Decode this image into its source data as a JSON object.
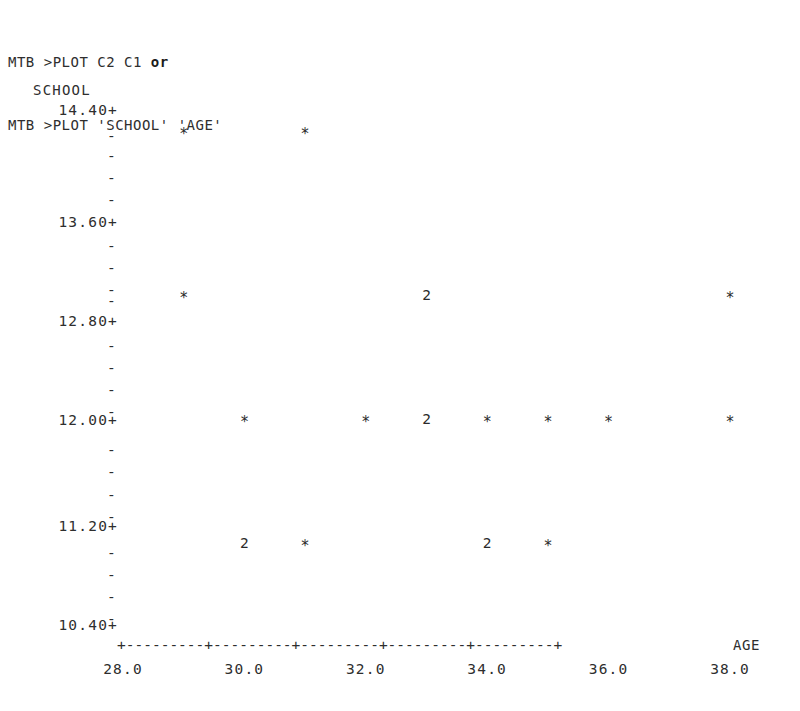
{
  "terminal": {
    "lines": [
      {
        "prompt": "MTB >PLOT C2 C1 ",
        "suffix": "or"
      },
      {
        "prompt": "MTB >PLOT 'SCHOOL' 'AGE'",
        "suffix": ""
      }
    ],
    "line1_full": "MTB >PLOT C2 C1 or",
    "line2_full": "MTB >PLOT 'SCHOOL' 'AGE'"
  },
  "axis": {
    "y_title": "SCHOOL",
    "x_title": "AGE",
    "axis_line": "+---------+---------+---------+---------+---------+",
    "tick_dash": "-",
    "tick_plus": "+"
  },
  "chart_data": {
    "type": "scatter",
    "title": "",
    "subtitle": "",
    "xlabel": "AGE",
    "ylabel": "SCHOOL",
    "xlim": [
      27.0,
      39.0
    ],
    "ylim": [
      10.4,
      14.4
    ],
    "xticks": [
      "28.0",
      "30.0",
      "32.0",
      "34.0",
      "36.0",
      "38.0"
    ],
    "xtick_values": [
      28.0,
      30.0,
      32.0,
      34.0,
      36.0,
      38.0
    ],
    "yticks": [
      "14.40+",
      "13.60+",
      "12.80+",
      "12.00+",
      "11.20+",
      "10.40+"
    ],
    "ytick_values": [
      14.4,
      13.6,
      12.8,
      12.0,
      11.2,
      10.4
    ],
    "minor_ticks_per_interval": 4,
    "grid": false,
    "legend": false,
    "marker_symbol": "*",
    "overlap_symbol_note": "digit indicates number of coincident points",
    "points": [
      {
        "x": 29.0,
        "y": 14.24,
        "symbol": "*",
        "count": 1
      },
      {
        "x": 31.0,
        "y": 14.24,
        "symbol": "*",
        "count": 1
      },
      {
        "x": 29.0,
        "y": 12.96,
        "symbol": "*",
        "count": 1
      },
      {
        "x": 33.0,
        "y": 12.96,
        "symbol": "2",
        "count": 2
      },
      {
        "x": 38.0,
        "y": 12.96,
        "symbol": "*",
        "count": 1
      },
      {
        "x": 30.0,
        "y": 12.0,
        "symbol": "*",
        "count": 1
      },
      {
        "x": 32.0,
        "y": 12.0,
        "symbol": "*",
        "count": 1
      },
      {
        "x": 33.0,
        "y": 12.0,
        "symbol": "2",
        "count": 2
      },
      {
        "x": 34.0,
        "y": 12.0,
        "symbol": "*",
        "count": 1
      },
      {
        "x": 35.0,
        "y": 12.0,
        "symbol": "*",
        "count": 1
      },
      {
        "x": 36.0,
        "y": 12.0,
        "symbol": "*",
        "count": 1
      },
      {
        "x": 38.0,
        "y": 12.0,
        "symbol": "*",
        "count": 1
      },
      {
        "x": 30.0,
        "y": 11.04,
        "symbol": "2",
        "count": 2
      },
      {
        "x": 31.0,
        "y": 11.04,
        "symbol": "*",
        "count": 1
      },
      {
        "x": 34.0,
        "y": 11.04,
        "symbol": "2",
        "count": 2
      },
      {
        "x": 35.0,
        "y": 11.04,
        "symbol": "*",
        "count": 1
      }
    ]
  },
  "layout": {
    "ytick_rows": [
      {
        "label": "14.40+",
        "top": 102
      },
      {
        "label": "13.60+",
        "top": 214
      },
      {
        "label": "12.80+",
        "top": 313
      },
      {
        "label": "12.00+",
        "top": 412
      },
      {
        "label": "11.20+",
        "top": 518
      },
      {
        "label": "10.40+",
        "top": 617
      }
    ],
    "minor_rows": [
      128,
      148,
      170,
      192,
      238,
      260,
      282,
      293,
      338,
      360,
      382,
      404,
      442,
      464,
      487,
      509,
      545,
      567,
      589,
      611
    ]
  }
}
